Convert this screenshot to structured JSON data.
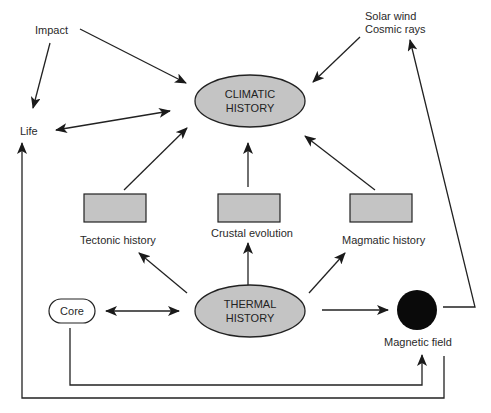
{
  "diagram": {
    "nodes": {
      "climatic_history": [
        "CLIMATIC",
        "HISTORY"
      ],
      "thermal_history": [
        "THERMAL",
        "HISTORY"
      ],
      "impact": "Impact",
      "life": "Life",
      "solar_wind": [
        "Solar wind",
        "Cosmic rays"
      ],
      "tectonic_history": "Tectonic history",
      "crustal_evolution": "Crustal evolution",
      "magmatic_history": "Magmatic history",
      "core": "Core",
      "magnetic_field": "Magnetic field"
    },
    "edges": [
      {
        "from": "Impact",
        "to": "Climatic history",
        "type": "directed"
      },
      {
        "from": "Impact",
        "to": "Life",
        "type": "directed"
      },
      {
        "from": "Life",
        "to": "Climatic history",
        "type": "bidirectional"
      },
      {
        "from": "Solar wind / Cosmic rays",
        "to": "Climatic history",
        "type": "directed"
      },
      {
        "from": "Tectonic history",
        "to": "Climatic history",
        "type": "directed"
      },
      {
        "from": "Crustal evolution",
        "to": "Climatic history",
        "type": "directed"
      },
      {
        "from": "Magmatic history",
        "to": "Climatic history",
        "type": "directed"
      },
      {
        "from": "Thermal history",
        "to": "Tectonic history",
        "type": "directed"
      },
      {
        "from": "Thermal history",
        "to": "Crustal evolution",
        "type": "directed"
      },
      {
        "from": "Thermal history",
        "to": "Magmatic history",
        "type": "directed"
      },
      {
        "from": "Core",
        "to": "Thermal history",
        "type": "bidirectional"
      },
      {
        "from": "Thermal history",
        "to": "Magnetic field",
        "type": "directed"
      },
      {
        "from": "Core",
        "to": "Magnetic field",
        "type": "directed"
      },
      {
        "from": "Magnetic field",
        "to": "Life",
        "type": "directed"
      },
      {
        "from": "Magnetic field",
        "to": "Solar wind / Cosmic rays",
        "type": "directed"
      }
    ],
    "colors": {
      "ellipse_fill": "#c4c4c4",
      "rect_fill": "#c4c4c4",
      "magnetic_field_fill": "#0a0a0a",
      "stroke": "#222222"
    }
  }
}
